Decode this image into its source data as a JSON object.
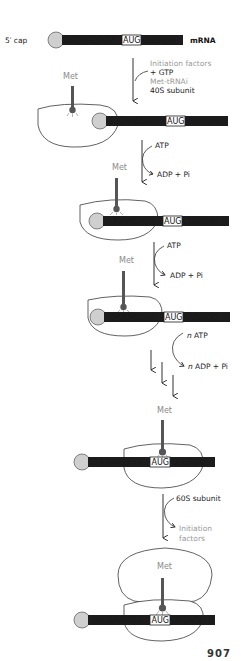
{
  "figure": {
    "topic": "Eukaryotic translation initiation",
    "page_number": "907"
  },
  "mrna": {
    "cap_label": "5′ cap",
    "mrna_label": "mRNA",
    "seq_left": "GUCAACGGU",
    "start_codon": "AUG",
    "seq_right": "CUGAGU"
  },
  "trna": {
    "amino_acid_label": "Met"
  },
  "steps": [
    {
      "id": "step1",
      "reagents_in": [
        "Initiation factors",
        "+ GTP",
        "Met-tRNAi",
        "40S subunit"
      ],
      "reagent_styles": [
        "grey",
        "dark",
        "grey",
        "dark"
      ]
    },
    {
      "id": "step2",
      "input": "ATP",
      "output": "ADP + Pi"
    },
    {
      "id": "step3",
      "input": "ATP",
      "output": "ADP + Pi"
    },
    {
      "id": "step4",
      "input_n": "n",
      "input": "ATP",
      "output_n": "n",
      "output": "ADP + Pi"
    },
    {
      "id": "step5",
      "input": "60S subunit",
      "output_line1": "Initiation",
      "output_line2": "factors"
    }
  ],
  "colors": {
    "mrna_fill": "#1c1c1c",
    "cap_fill": "#cfcfcf",
    "trna_fill": "#555555",
    "ribosome_stroke": "#3a3a3a",
    "grey_text": "#9a9a9a"
  }
}
